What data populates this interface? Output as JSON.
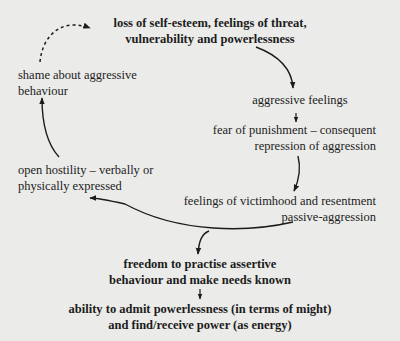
{
  "diagram": {
    "type": "cycle-flow",
    "background": "#ebebe9",
    "ink": "#1c1c1c",
    "nodes": [
      {
        "id": "loss",
        "lines": [
          "loss of self-esteem, feelings of threat,",
          "vulnerability and powerlessness"
        ],
        "bold": true
      },
      {
        "id": "aggressive-feelings",
        "lines": [
          "aggressive feelings"
        ],
        "bold": false
      },
      {
        "id": "fear",
        "lines": [
          "fear of punishment – consequent",
          "repression of aggression"
        ],
        "bold": false
      },
      {
        "id": "victimhood",
        "lines": [
          "feelings of victimhood and resentment",
          "passive-aggression"
        ],
        "bold": false
      },
      {
        "id": "hostility",
        "lines": [
          "open hostility – verbally or",
          "physically expressed"
        ],
        "bold": false
      },
      {
        "id": "shame",
        "lines": [
          "shame about aggressive",
          "behaviour"
        ],
        "bold": false
      },
      {
        "id": "freedom",
        "lines": [
          "freedom to practise assertive",
          "behaviour and make needs known"
        ],
        "bold": true
      },
      {
        "id": "ability",
        "lines": [
          "ability to admit powerlessness (in terms of might)",
          "and find/receive power (as energy)"
        ],
        "bold": true
      }
    ],
    "edges": [
      {
        "from": "loss",
        "to": "aggressive-feelings",
        "style": "solid"
      },
      {
        "from": "aggressive-feelings",
        "to": "fear",
        "style": "solid"
      },
      {
        "from": "fear",
        "to": "victimhood",
        "style": "solid"
      },
      {
        "from": "victimhood",
        "to": "hostility",
        "style": "solid"
      },
      {
        "from": "victimhood",
        "to": "freedom",
        "style": "solid"
      },
      {
        "from": "hostility",
        "to": "shame",
        "style": "solid"
      },
      {
        "from": "shame",
        "to": "loss",
        "style": "dashed"
      },
      {
        "from": "freedom",
        "to": "ability",
        "style": "solid"
      }
    ]
  }
}
